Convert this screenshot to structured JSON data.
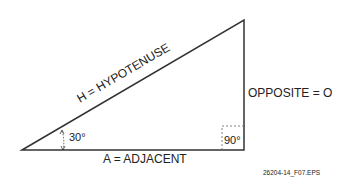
{
  "diagram": {
    "type": "right-triangle",
    "hypotenuse_label": "H = HYPOTENUSE",
    "opposite_label": "OPPOSITE = O",
    "adjacent_label": "A = ADJACENT",
    "angle_label": "30°",
    "right_angle_label": "90°",
    "figure_id": "26204-14_F07.EPS",
    "line_color": "#333333"
  }
}
